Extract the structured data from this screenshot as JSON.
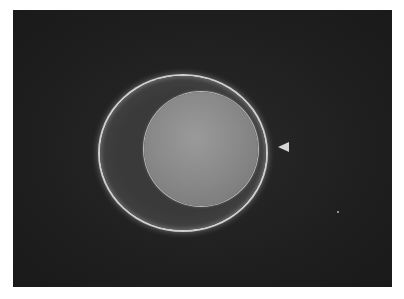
{
  "image": {
    "frame": {
      "x": 13,
      "y": 10,
      "width": 379,
      "height": 277,
      "background": "#1f1f1f"
    },
    "zona_pellucida": {
      "cx": 195,
      "cy": 151,
      "rx": 83,
      "ry": 77,
      "rim_color": "#cfcfcf"
    },
    "oocyte": {
      "cx": 201,
      "cy": 149,
      "r": 57,
      "fill": "#8a8a8a"
    },
    "arrowhead": {
      "x": 278,
      "y": 142,
      "direction": "left",
      "color": "#d6d6d6"
    },
    "speck": {
      "x": 337,
      "y": 211
    }
  }
}
